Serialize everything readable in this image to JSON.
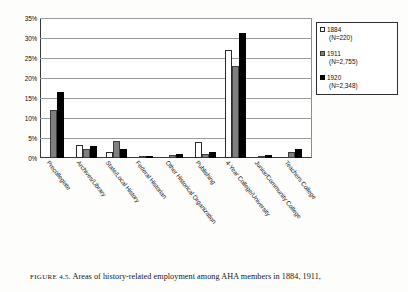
{
  "figure": {
    "caption_prefix": "FIGURE 4.5.",
    "caption_text": "Areas of history-related employment among AHA members in 1884, 1911,"
  },
  "legend": {
    "position": "right",
    "items": [
      {
        "label": "1884",
        "n": "(N=220)",
        "swatch": "white-square-icon"
      },
      {
        "label": "1911",
        "n": "(N=2,755)",
        "swatch": "gray-square-icon"
      },
      {
        "label": "1920",
        "n": "(N=2,348)",
        "swatch": "black-square-icon"
      }
    ]
  },
  "axis": {
    "y_ticks": [
      "35%",
      "30%",
      "25%",
      "20%",
      "15%",
      "10%",
      "5%",
      "0%"
    ]
  },
  "chart_data": {
    "type": "bar",
    "title": "",
    "xlabel": "",
    "ylabel": "",
    "ylim": [
      0,
      35
    ],
    "grid": true,
    "legend_position": "right",
    "categories": [
      "Precollegiate",
      "Archives/Library",
      "State/Local History",
      "Federal Historian",
      "Other Historical Organization",
      "Publishing",
      "4-Year College/University",
      "Junior/Community College",
      "Teachers College"
    ],
    "series": [
      {
        "name": "1884",
        "n": 220,
        "values": [
          0,
          3.2,
          1.5,
          0,
          0,
          4.0,
          27.0,
          0,
          0
        ]
      },
      {
        "name": "1911",
        "n": 2755,
        "values": [
          12.0,
          2.2,
          4.3,
          0.4,
          0.8,
          0.9,
          23.0,
          0.6,
          1.4
        ]
      },
      {
        "name": "1920",
        "n": 2348,
        "values": [
          16.5,
          3.0,
          2.3,
          0.5,
          1.0,
          1.6,
          31.2,
          0.7,
          2.2
        ]
      }
    ]
  }
}
